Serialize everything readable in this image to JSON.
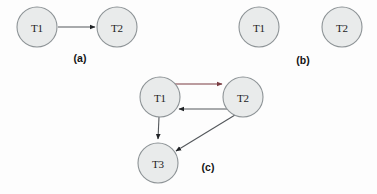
{
  "figure": {
    "background_color": "#fdfdfd",
    "node_fill_color": "#e9ebeb",
    "node_stroke_color": "#8d9396",
    "edge_color": "#54585c",
    "accent_edge_color": "#7a3c42",
    "node_radius": 20
  },
  "panels": [
    {
      "id": "a",
      "caption": "(a)",
      "caption_pos": {
        "x": 80,
        "y": 58
      },
      "nodes": [
        {
          "id": "a-t1",
          "label": "T1",
          "cx": 37,
          "cy": 27
        },
        {
          "id": "a-t2",
          "label": "T2",
          "cx": 117,
          "cy": 27
        }
      ],
      "edges": [
        {
          "id": "a-t1-t2",
          "from": "T1",
          "to": "T2",
          "color": "#54585c"
        }
      ]
    },
    {
      "id": "b",
      "caption": "(b)",
      "caption_pos": {
        "x": 303,
        "y": 60
      },
      "nodes": [
        {
          "id": "b-t1",
          "label": "T1",
          "cx": 259,
          "cy": 27
        },
        {
          "id": "b-t2",
          "label": "T2",
          "cx": 342,
          "cy": 27
        }
      ],
      "edges": []
    },
    {
      "id": "c",
      "caption": "(c)",
      "caption_pos": {
        "x": 208,
        "y": 167
      },
      "nodes": [
        {
          "id": "c-t1",
          "label": "T1",
          "cx": 160,
          "cy": 97
        },
        {
          "id": "c-t2",
          "label": "T2",
          "cx": 243,
          "cy": 97
        },
        {
          "id": "c-t3",
          "label": "T3",
          "cx": 158,
          "cy": 163
        }
      ],
      "edges": [
        {
          "id": "c-t1-t2",
          "from": "T1",
          "to": "T2",
          "color": "#7a3c42"
        },
        {
          "id": "c-t2-t1",
          "from": "T2",
          "to": "T1",
          "color": "#54585c"
        },
        {
          "id": "c-t1-t3",
          "from": "T1",
          "to": "T3",
          "color": "#54585c"
        },
        {
          "id": "c-t2-t3",
          "from": "T2",
          "to": "T3",
          "color": "#54585c"
        }
      ]
    }
  ]
}
